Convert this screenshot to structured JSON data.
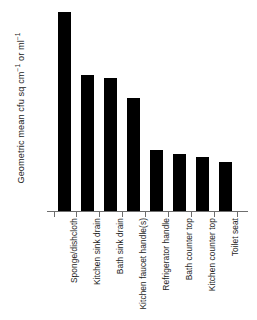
{
  "chart_data": {
    "type": "bar",
    "title": "",
    "xlabel": "",
    "ylabel": "Geometric mean cfu sq cm",
    "ylabel_sup1": "−1",
    "ylabel_mid": " or ml",
    "ylabel_sup2": "−1",
    "ylabel_full": "Geometric mean cfu sq cm−1 or ml−1",
    "categories": [
      "Sponge/dishcloth",
      "Kitchen sink drain",
      "Bath sink drain",
      "Kitchen faucet handle(s)",
      "Refrigerator handle",
      "Bath counter top",
      "Kitchen counter top",
      "Toilet seat"
    ],
    "values": [
      200,
      137,
      134,
      114,
      62,
      58,
      55,
      50
    ],
    "ylim": [
      0,
      206
    ],
    "grid": false,
    "legend": false,
    "y_tick_labels": [],
    "bar_color": "#000000",
    "axis_color": "#6e6e6e",
    "background": "#ffffff"
  }
}
